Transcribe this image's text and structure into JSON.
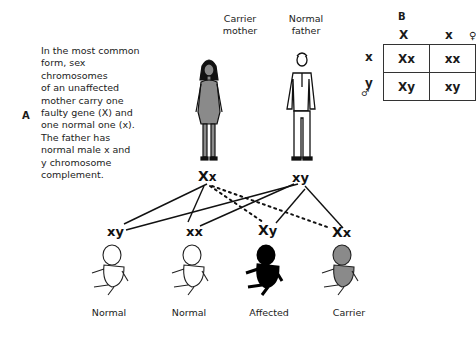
{
  "panel_a": {
    "label": "A",
    "description": "In the most common\nform, sex\nchromosomes\nof an unaffected\nmother carry  one\nfaulty gene (X) and\none normal one (x).\nThe father has\nnormal male x and\ny chromosome\ncomplement."
  },
  "parents": {
    "mother": {
      "label": "Carrier\nmother",
      "genotype_big": "X",
      "genotype_small": "x",
      "fill": "#8a8a8a"
    },
    "father": {
      "label": "Normal\nfather",
      "genotype_big": "x",
      "genotype_small": "y"
    }
  },
  "children": [
    {
      "genotype_a": "x",
      "genotype_b": "y",
      "label": "Normal",
      "fill": "#ffffff"
    },
    {
      "genotype_a": "x",
      "genotype_b": "x",
      "label": "Normal",
      "fill": "#ffffff"
    },
    {
      "genotype_a": "X",
      "genotype_b": "y",
      "label": "Affected",
      "fill": "#000000"
    },
    {
      "genotype_a": "X",
      "genotype_b": "x",
      "label": "Carrier",
      "fill": "#8a8a8a"
    }
  ],
  "panel_b": {
    "label": "B",
    "female_symbol": "♀",
    "male_symbol": "♂",
    "col_headers": [
      "X",
      "x"
    ],
    "row_headers": [
      "x",
      "y"
    ],
    "cells": [
      [
        "Xx",
        "xx"
      ],
      [
        "Xy",
        "xy"
      ]
    ]
  }
}
